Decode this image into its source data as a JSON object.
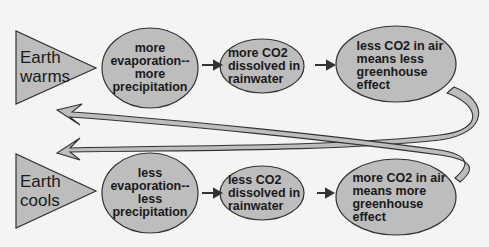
{
  "diagram": {
    "colors": {
      "fill": "#bdbdbd",
      "stroke": "#333333",
      "background": "#f4f4f2"
    },
    "top_row": {
      "trigger": {
        "lines": [
          "Earth",
          "warms"
        ]
      },
      "step1": {
        "lines": [
          "more",
          "evaporation--",
          "more",
          "precipitation"
        ]
      },
      "step2": {
        "lines": [
          "more CO2",
          "dissolved in",
          "rainwater"
        ]
      },
      "step3": {
        "lines": [
          "less CO2 in air",
          "means less",
          "greenhouse",
          "effect"
        ]
      }
    },
    "bottom_row": {
      "trigger": {
        "lines": [
          "Earth",
          "cools"
        ]
      },
      "step1": {
        "lines": [
          "less",
          "evaporation--",
          "less",
          "precipitation"
        ]
      },
      "step2": {
        "lines": [
          "less CO2",
          "dissolved in",
          "rainwater"
        ]
      },
      "step3": {
        "lines": [
          "more CO2 in air",
          "means more",
          "greenhouse",
          "effect"
        ]
      }
    },
    "feedback_arrows": [
      {
        "from": "top_row.step3",
        "to": "bottom_row.trigger",
        "meaning": "less greenhouse effect leads to Earth cooling"
      },
      {
        "from": "bottom_row.step3",
        "to": "top_row.trigger",
        "meaning": "more greenhouse effect leads to Earth warming"
      }
    ]
  }
}
